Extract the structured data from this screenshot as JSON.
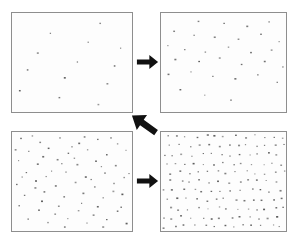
{
  "figure": {
    "background_color": "#ffffff",
    "panel_background_color": "#fdfdfd",
    "panel_border_color": "#8e8e8e",
    "dot_color": "#6b6b6b",
    "arrow_color": "#111111"
  },
  "panels": [
    {
      "id": "panel-top-left",
      "name": "top-left-point-pattern",
      "order": 1,
      "rect": {
        "x": 11,
        "y": 12,
        "w": 122,
        "h": 101
      },
      "point_count": 13,
      "density_label": "sparse",
      "points": [
        [
          0.735,
          0.105
        ],
        [
          0.32,
          0.205
        ],
        [
          0.635,
          0.295
        ],
        [
          0.905,
          0.355
        ],
        [
          0.215,
          0.405
        ],
        [
          0.545,
          0.495
        ],
        [
          0.855,
          0.535
        ],
        [
          0.13,
          0.575
        ],
        [
          0.44,
          0.655
        ],
        [
          0.795,
          0.715
        ],
        [
          0.065,
          0.785
        ],
        [
          0.395,
          0.855
        ],
        [
          0.72,
          0.925
        ]
      ]
    },
    {
      "id": "panel-top-right",
      "name": "top-right-point-pattern",
      "order": 2,
      "rect": {
        "x": 160,
        "y": 12,
        "w": 127,
        "h": 101
      },
      "point_count": 31,
      "density_label": "low",
      "points": [
        [
          0.3,
          0.085
        ],
        [
          0.505,
          0.105
        ],
        [
          0.69,
          0.135
        ],
        [
          0.865,
          0.09
        ],
        [
          0.105,
          0.185
        ],
        [
          0.265,
          0.225
        ],
        [
          0.43,
          0.245
        ],
        [
          0.62,
          0.265
        ],
        [
          0.8,
          0.215
        ],
        [
          0.945,
          0.29
        ],
        [
          0.055,
          0.33
        ],
        [
          0.19,
          0.37
        ],
        [
          0.355,
          0.395
        ],
        [
          0.54,
          0.345
        ],
        [
          0.72,
          0.4
        ],
        [
          0.885,
          0.375
        ],
        [
          0.115,
          0.47
        ],
        [
          0.305,
          0.49
        ],
        [
          0.47,
          0.455
        ],
        [
          0.645,
          0.52
        ],
        [
          0.83,
          0.49
        ],
        [
          0.975,
          0.545
        ],
        [
          0.06,
          0.62
        ],
        [
          0.24,
          0.595
        ],
        [
          0.415,
          0.64
        ],
        [
          0.595,
          0.665
        ],
        [
          0.775,
          0.625
        ],
        [
          0.93,
          0.7
        ],
        [
          0.155,
          0.775
        ],
        [
          0.35,
          0.83
        ],
        [
          0.56,
          0.88
        ]
      ]
    },
    {
      "id": "panel-bottom-left",
      "name": "bottom-left-point-pattern",
      "order": 3,
      "rect": {
        "x": 11,
        "y": 131,
        "w": 122,
        "h": 101
      },
      "point_count": 70,
      "density_label": "medium",
      "points": [
        [
          0.075,
          0.065
        ],
        [
          0.235,
          0.105
        ],
        [
          0.4,
          0.06
        ],
        [
          0.56,
          0.115
        ],
        [
          0.715,
          0.075
        ],
        [
          0.88,
          0.12
        ],
        [
          0.14,
          0.195
        ],
        [
          0.305,
          0.165
        ],
        [
          0.47,
          0.215
        ],
        [
          0.63,
          0.18
        ],
        [
          0.79,
          0.23
        ],
        [
          0.95,
          0.185
        ],
        [
          0.055,
          0.29
        ],
        [
          0.215,
          0.325
        ],
        [
          0.38,
          0.28
        ],
        [
          0.545,
          0.33
        ],
        [
          0.7,
          0.295
        ],
        [
          0.865,
          0.34
        ],
        [
          0.12,
          0.41
        ],
        [
          0.285,
          0.45
        ],
        [
          0.45,
          0.405
        ],
        [
          0.615,
          0.455
        ],
        [
          0.775,
          0.415
        ],
        [
          0.935,
          0.46
        ],
        [
          0.04,
          0.53
        ],
        [
          0.2,
          0.495
        ],
        [
          0.365,
          0.545
        ],
        [
          0.53,
          0.51
        ],
        [
          0.69,
          0.555
        ],
        [
          0.85,
          0.52
        ],
        [
          0.105,
          0.64
        ],
        [
          0.27,
          0.605
        ],
        [
          0.435,
          0.655
        ],
        [
          0.595,
          0.62
        ],
        [
          0.76,
          0.665
        ],
        [
          0.92,
          0.63
        ],
        [
          0.06,
          0.745
        ],
        [
          0.225,
          0.79
        ],
        [
          0.39,
          0.75
        ],
        [
          0.555,
          0.795
        ],
        [
          0.715,
          0.755
        ],
        [
          0.88,
          0.8
        ],
        [
          0.135,
          0.88
        ],
        [
          0.3,
          0.915
        ],
        [
          0.465,
          0.875
        ],
        [
          0.625,
          0.92
        ],
        [
          0.79,
          0.885
        ],
        [
          0.955,
          0.925
        ],
        [
          0.17,
          0.04
        ],
        [
          0.33,
          0.395
        ],
        [
          0.5,
          0.15
        ],
        [
          0.66,
          0.48
        ],
        [
          0.825,
          0.06
        ],
        [
          0.085,
          0.455
        ],
        [
          0.25,
          0.7
        ],
        [
          0.415,
          0.32
        ],
        [
          0.58,
          0.72
        ],
        [
          0.745,
          0.35
        ],
        [
          0.91,
          0.76
        ],
        [
          0.03,
          0.18
        ],
        [
          0.195,
          0.565
        ],
        [
          0.36,
          0.83
        ],
        [
          0.52,
          0.265
        ],
        [
          0.68,
          0.84
        ],
        [
          0.845,
          0.6
        ],
        [
          0.975,
          0.42
        ],
        [
          0.26,
          0.25
        ],
        [
          0.605,
          0.05
        ],
        [
          0.44,
          0.96
        ],
        [
          0.76,
          0.96
        ]
      ]
    },
    {
      "id": "panel-bottom-right",
      "name": "bottom-right-point-pattern",
      "order": 4,
      "rect": {
        "x": 160,
        "y": 131,
        "w": 127,
        "h": 101
      },
      "point_count": 143,
      "density_label": "high",
      "lattice": {
        "type": "sheared-grid",
        "columns": 13,
        "rows": 11,
        "shear_per_row": 0.055,
        "jitter": 0.018
      },
      "points": []
    }
  ],
  "arrows": [
    {
      "id": "arrow-top",
      "name": "arrow-top-left-to-top-right",
      "direction": "right",
      "angle_deg": 0,
      "rect": {
        "x": 136,
        "y": 52,
        "w": 23,
        "h": 20
      },
      "from_panel": "panel-top-left",
      "to_panel": "panel-top-right"
    },
    {
      "id": "arrow-middle",
      "name": "arrow-top-right-to-bottom-left",
      "direction": "down-left",
      "angle_deg": 215,
      "rect": {
        "x": 128,
        "y": 111,
        "w": 32,
        "h": 26
      },
      "from_panel": "panel-top-right",
      "to_panel": "panel-bottom-left"
    },
    {
      "id": "arrow-bottom",
      "name": "arrow-bottom-left-to-bottom-right",
      "direction": "right",
      "angle_deg": 0,
      "rect": {
        "x": 136,
        "y": 171,
        "w": 23,
        "h": 20
      },
      "from_panel": "panel-bottom-left",
      "to_panel": "panel-bottom-right"
    }
  ]
}
